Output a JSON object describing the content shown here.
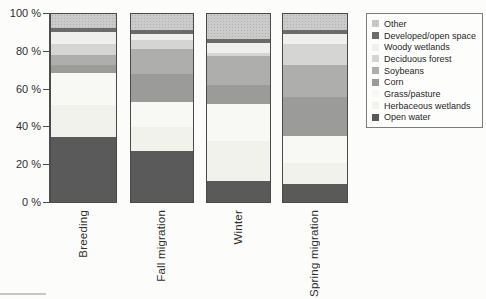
{
  "figure": {
    "background": "#fcfcfb",
    "border_color": "#4a4a4a"
  },
  "y_axis": {
    "ticks": [
      "100 %",
      "80 %",
      "60 %",
      "40 %",
      "20 %",
      "0 %"
    ]
  },
  "x_axis": {
    "labels": [
      "Breeding",
      "Fall migration",
      "Winter",
      "Spring migration"
    ]
  },
  "legend": {
    "position": "top-right",
    "items": [
      {
        "label": "Other",
        "color": "#cbcbcb",
        "textured": true
      },
      {
        "label": "Developed/open space",
        "color": "#6b6b6b",
        "textured": false
      },
      {
        "label": "Woody wetlands",
        "color": "#efefed",
        "textured": false
      },
      {
        "label": "Deciduous forest",
        "color": "#d5d5d3",
        "textured": false
      },
      {
        "label": "Soybeans",
        "color": "#aeaeac",
        "textured": false
      },
      {
        "label": "Corn",
        "color": "#9b9b99",
        "textured": false
      },
      {
        "label": "Grass/pasture",
        "color": "#f8f8f4",
        "textured": false
      },
      {
        "label": "Herbaceous wetlands",
        "color": "#f2f2ec",
        "textured": false
      },
      {
        "label": "Open water",
        "color": "#5a5a5a",
        "textured": false
      }
    ]
  },
  "chart_data": {
    "type": "bar",
    "stacked": true,
    "unit": "percent",
    "title": "",
    "xlabel": "",
    "ylabel": "",
    "ylim": [
      0,
      100
    ],
    "grid": false,
    "categories": [
      "Breeding",
      "Fall migration",
      "Winter",
      "Spring migration"
    ],
    "stack_order_top_to_bottom": [
      "Other",
      "Developed/open space",
      "Woody wetlands",
      "Deciduous forest",
      "Soybeans",
      "Corn",
      "Grass/pasture",
      "Herbaceous wetlands",
      "Open water"
    ],
    "series": [
      {
        "name": "Other",
        "values": [
          7.5,
          8.5,
          13.5,
          8.5
        ]
      },
      {
        "name": "Developed/open space",
        "values": [
          2,
          2,
          2,
          2
        ]
      },
      {
        "name": "Woody wetlands",
        "values": [
          6.5,
          3.5,
          5,
          5.5
        ]
      },
      {
        "name": "Deciduous forest",
        "values": [
          6,
          4.5,
          2,
          11
        ]
      },
      {
        "name": "Soybeans",
        "values": [
          5,
          13.5,
          15,
          17
        ]
      },
      {
        "name": "Corn",
        "values": [
          4.5,
          15,
          10.5,
          21
        ]
      },
      {
        "name": "Grass/pasture",
        "values": [
          17,
          13,
          19.5,
          14.5
        ]
      },
      {
        "name": "Herbaceous wetlands",
        "values": [
          17,
          13,
          21.5,
          11
        ]
      },
      {
        "name": "Open water",
        "values": [
          34.5,
          27,
          11,
          9.5
        ]
      }
    ]
  }
}
